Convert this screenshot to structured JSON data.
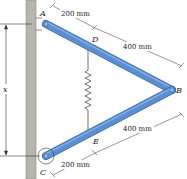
{
  "diagram": {
    "type": "mechanism",
    "points": {
      "A": "A",
      "B": "B",
      "C": "C",
      "D": "D",
      "E": "E"
    },
    "dimensions": {
      "AD": "200 mm",
      "DB": "400 mm",
      "BE": "400 mm",
      "EC": "200 mm",
      "x": "x"
    },
    "colors": {
      "bar": "#5b8fd0",
      "bar_edge": "#2f5f9e",
      "wall": "#b8b4ae",
      "wall_edge": "#8a8680",
      "line": "#333333"
    }
  }
}
